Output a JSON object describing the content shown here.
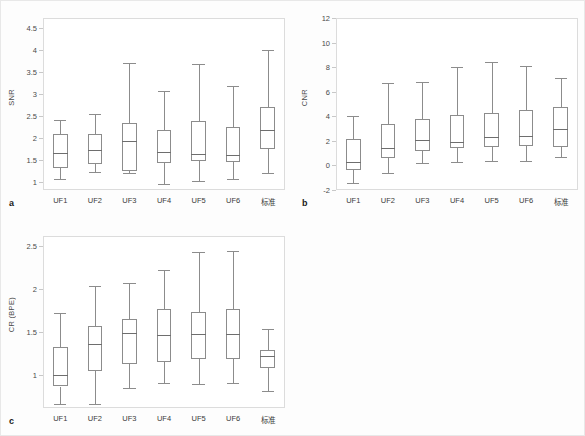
{
  "figure": {
    "background": "#fdfdfd",
    "border_color": "#e8e8e8",
    "line_color": "#8c8c8c",
    "frame_color": "#dcdcdc"
  },
  "panels": [
    {
      "letter": "a",
      "ylabel": "SNR",
      "yticks": [
        "1",
        "1.5",
        "2",
        "2.5",
        "3",
        "3.5",
        "4",
        "4.5"
      ],
      "xticks": [
        "UF1",
        "UF2",
        "UF3",
        "UF4",
        "UF5",
        "UF6",
        "标准"
      ]
    },
    {
      "letter": "b",
      "ylabel": "CNR",
      "yticks": [
        "-2",
        "0",
        "2",
        "4",
        "6",
        "8",
        "10",
        "12"
      ],
      "xticks": [
        "UF1",
        "UF2",
        "UF3",
        "UF4",
        "UF5",
        "UF6",
        "标准"
      ]
    },
    {
      "letter": "c",
      "ylabel": "CR (BPE)",
      "yticks": [
        "1",
        "1.5",
        "2",
        "2.5"
      ],
      "xticks": [
        "UF1",
        "UF2",
        "UF3",
        "UF4",
        "UF5",
        "UF6",
        "标准"
      ]
    }
  ],
  "chart_data": [
    {
      "type": "box",
      "panel": "a",
      "title": "",
      "xlabel": "",
      "ylabel": "SNR",
      "ylim": [
        0.82,
        4.72
      ],
      "yticks": [
        1,
        1.5,
        2,
        2.5,
        3,
        3.5,
        4,
        4.5
      ],
      "grid": false,
      "legend": null,
      "categories": [
        "UF1",
        "UF2",
        "UF3",
        "UF4",
        "UF5",
        "UF6",
        "标准"
      ],
      "boxes": [
        {
          "category": "UF1",
          "min": 1.06,
          "q1": 1.32,
          "median": 1.65,
          "q3": 2.08,
          "max": 2.41
        },
        {
          "category": "UF2",
          "min": 1.23,
          "q1": 1.41,
          "median": 1.72,
          "q3": 2.09,
          "max": 2.54
        },
        {
          "category": "UF3",
          "min": 1.2,
          "q1": 1.24,
          "median": 1.93,
          "q3": 2.34,
          "max": 3.7
        },
        {
          "category": "UF4",
          "min": 0.96,
          "q1": 1.44,
          "median": 1.69,
          "q3": 2.19,
          "max": 3.06
        },
        {
          "category": "UF5",
          "min": 1.03,
          "q1": 1.47,
          "median": 1.64,
          "q3": 2.39,
          "max": 3.67
        },
        {
          "category": "UF6",
          "min": 1.06,
          "q1": 1.45,
          "median": 1.62,
          "q3": 2.24,
          "max": 3.17
        },
        {
          "category": "标准",
          "min": 1.2,
          "q1": 1.74,
          "median": 2.18,
          "q3": 2.7,
          "max": 4.0
        }
      ]
    },
    {
      "type": "box",
      "panel": "b",
      "title": "",
      "xlabel": "",
      "ylabel": "CNR",
      "ylim": [
        -2,
        12
      ],
      "yticks": [
        -2,
        0,
        2,
        4,
        6,
        8,
        10,
        12
      ],
      "grid": false,
      "legend": null,
      "categories": [
        "UF1",
        "UF2",
        "UF3",
        "UF4",
        "UF5",
        "UF6",
        "标准"
      ],
      "boxes": [
        {
          "category": "UF1",
          "min": -1.45,
          "q1": -0.35,
          "median": 0.25,
          "q3": 2.12,
          "max": 4.03
        },
        {
          "category": "UF2",
          "min": -0.6,
          "q1": 0.6,
          "median": 1.45,
          "q3": 3.35,
          "max": 6.72
        },
        {
          "category": "UF3",
          "min": 0.2,
          "q1": 1.15,
          "median": 2.05,
          "q3": 3.78,
          "max": 6.82
        },
        {
          "category": "UF4",
          "min": 0.28,
          "q1": 1.45,
          "median": 1.88,
          "q3": 4.08,
          "max": 8.05
        },
        {
          "category": "UF5",
          "min": 0.32,
          "q1": 1.52,
          "median": 2.28,
          "q3": 4.28,
          "max": 8.45
        },
        {
          "category": "UF6",
          "min": 0.4,
          "q1": 1.55,
          "median": 2.4,
          "q3": 4.5,
          "max": 8.1
        },
        {
          "category": "标准",
          "min": 0.7,
          "q1": 1.5,
          "median": 3.0,
          "q3": 4.72,
          "max": 7.15
        }
      ]
    },
    {
      "type": "box",
      "panel": "c",
      "title": "",
      "xlabel": "",
      "ylabel": "CR (BPE)",
      "ylim": [
        0.62,
        2.62
      ],
      "yticks": [
        1,
        1.5,
        2,
        2.5
      ],
      "grid": false,
      "legend": null,
      "categories": [
        "UF1",
        "UF2",
        "UF3",
        "UF4",
        "UF5",
        "UF6",
        "标准"
      ],
      "boxes": [
        {
          "category": "UF1",
          "min": 0.67,
          "q1": 0.87,
          "median": 1.0,
          "q3": 1.33,
          "max": 1.73
        },
        {
          "category": "UF2",
          "min": 0.67,
          "q1": 1.05,
          "median": 1.36,
          "q3": 1.57,
          "max": 2.04
        },
        {
          "category": "UF3",
          "min": 0.85,
          "q1": 1.13,
          "median": 1.49,
          "q3": 1.65,
          "max": 2.07
        },
        {
          "category": "UF4",
          "min": 0.91,
          "q1": 1.16,
          "median": 1.47,
          "q3": 1.77,
          "max": 2.23
        },
        {
          "category": "UF5",
          "min": 0.9,
          "q1": 1.19,
          "median": 1.48,
          "q3": 1.74,
          "max": 2.43
        },
        {
          "category": "UF6",
          "min": 0.91,
          "q1": 1.19,
          "median": 1.48,
          "q3": 1.77,
          "max": 2.44
        },
        {
          "category": "标准",
          "min": 0.82,
          "q1": 1.08,
          "median": 1.22,
          "q3": 1.29,
          "max": 1.54
        }
      ]
    }
  ]
}
